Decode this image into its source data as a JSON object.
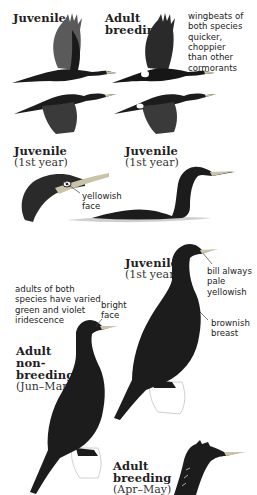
{
  "plate": {
    "colors": {
      "background": "#ffffff",
      "plumage": "#1a1a1a",
      "wing_gray": "#555555",
      "bill": "#c9c4a8",
      "water": "#cfcfcf",
      "text": "#1e1e1e"
    },
    "flight": {
      "juvenile": {
        "title": "Juvenile"
      },
      "adult_breeding": {
        "title_line1": "Adult",
        "title_line2": "breeding"
      },
      "note": "wingbeats of\nboth species\nquicker,\nchoppier\nthan other\ncormorants"
    },
    "juvenile_head": {
      "title": "Juvenile",
      "subtitle": "(1st year)",
      "note": "yellowish\nface"
    },
    "juvenile_swimming": {
      "title": "Juvenile",
      "subtitle": "(1st year)"
    },
    "juvenile_standing": {
      "title": "Juvenile",
      "subtitle": "(1st year)",
      "note_bill": "bill always\npale\nyellowish",
      "note_breast": "brownish\nbreast"
    },
    "iridescence_note": "adults of both\nspecies have varied\ngreen and violet\niridescence",
    "adult_nonbreeding": {
      "title_line1": "Adult",
      "title_line2": "non-",
      "title_line3": "breeding",
      "subtitle": "(Jun–Mar)",
      "note": "bright\nface"
    },
    "adult_breeding": {
      "title_line1": "Adult",
      "title_line2": "breeding",
      "subtitle": "(Apr–May)"
    }
  }
}
